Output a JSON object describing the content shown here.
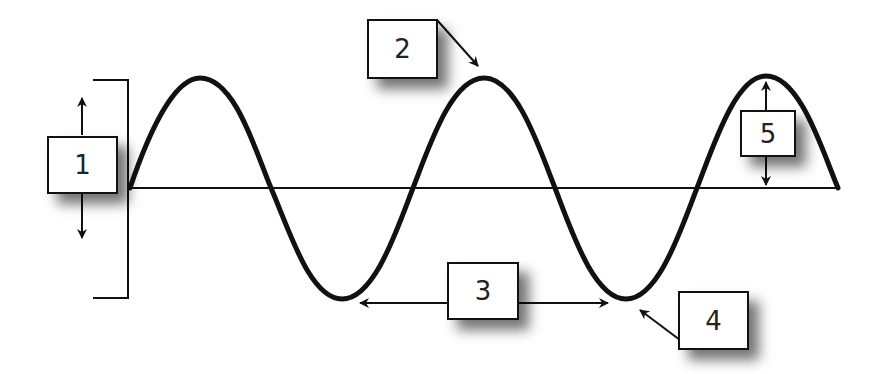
{
  "diagram": {
    "colors": {
      "line": "#111111",
      "background": "#ffffff",
      "box_border": "#111111",
      "text": "#222222"
    },
    "wave": {
      "baseline_y": 188,
      "x_start": 130,
      "x_end": 838,
      "amplitude_px": 110,
      "period_px": 284,
      "peaks_x": [
        200,
        484,
        766
      ],
      "troughs_x": [
        342,
        626
      ]
    },
    "labels": [
      {
        "id": "1",
        "text": "1",
        "meaning": "amplitude range (bracket with up/down arrows)"
      },
      {
        "id": "2",
        "text": "2",
        "meaning": "crest (arrow to peak)"
      },
      {
        "id": "3",
        "text": "3",
        "meaning": "wavelength (double arrow trough to trough)"
      },
      {
        "id": "4",
        "text": "4",
        "meaning": "trough (arrow to trough)"
      },
      {
        "id": "5",
        "text": "5",
        "meaning": "amplitude (height from baseline to crest)"
      }
    ]
  }
}
